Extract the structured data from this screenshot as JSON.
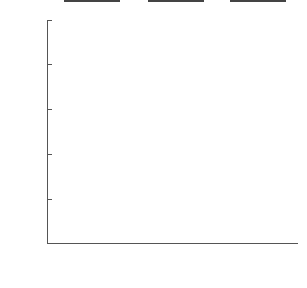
{
  "chart_data": {
    "type": "bar",
    "title": "",
    "xlabel": "",
    "ylabel": "Median length of lesions (mm)",
    "categories": [
      "No shock",
      "Signaled shock",
      "Unsignaled shock"
    ],
    "category_lines": [
      [
        "No shock"
      ],
      [
        "Signaled",
        "shock"
      ],
      [
        "Unsignaled",
        "shock"
      ]
    ],
    "values": [
      0.6,
      1.4,
      9.0
    ],
    "colors": [
      "#b8b8b8",
      "#9a9a9a",
      "#7a7a7a"
    ],
    "ylim": [
      0,
      10
    ],
    "yticks": [
      2,
      4,
      6,
      8,
      10
    ],
    "ytick_labels": [
      "2",
      "4",
      "6",
      "8",
      "10"
    ],
    "grid": false,
    "legend": null
  }
}
